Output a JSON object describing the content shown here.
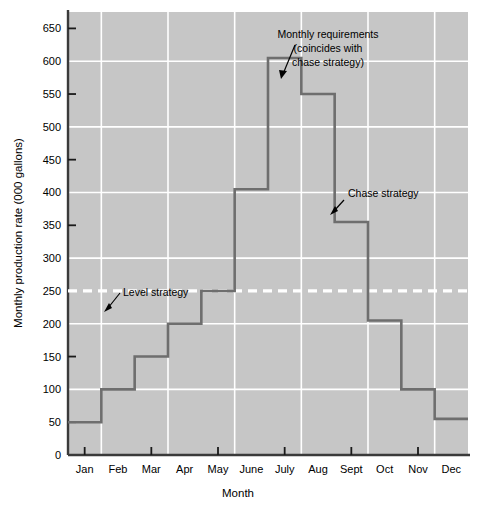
{
  "chart_data": {
    "type": "line",
    "subtype": "step",
    "title": "",
    "xlabel": "Month",
    "ylabel": "Monthly production rate (000 gallons)",
    "categories": [
      "Jan",
      "Feb",
      "Mar",
      "Apr",
      "May",
      "June",
      "July",
      "Aug",
      "Sept",
      "Oct",
      "Nov",
      "Dec"
    ],
    "series": [
      {
        "name": "Monthly requirements (coincides with chase strategy)",
        "step": "post",
        "color": "#6e6e6e",
        "values": [
          50,
          100,
          150,
          200,
          250,
          405,
          605,
          550,
          355,
          205,
          100,
          55
        ]
      },
      {
        "name": "Level strategy",
        "style": "dashed",
        "color": "#ffffff",
        "constant_value": 250
      }
    ],
    "ylim": [
      0,
      675
    ],
    "ytick_values": [
      0,
      50,
      100,
      150,
      200,
      250,
      300,
      350,
      400,
      450,
      500,
      550,
      600,
      650
    ],
    "ytick_labels": [
      "0",
      "50",
      "100",
      "150",
      "200",
      "250",
      "300",
      "350",
      "400",
      "450",
      "500",
      "550",
      "600",
      "650"
    ],
    "ygrid_values": [
      100,
      200,
      300,
      400,
      500,
      600
    ],
    "xtick_labeled": [
      "Jan",
      "Mar",
      "May",
      "July",
      "Sept",
      "Nov"
    ],
    "grid": true,
    "grid_color": "#ffffff",
    "plot_background": "#c6c6c6",
    "legend_position": "none",
    "annotations": [
      {
        "name": "monthly-requirements-annotation",
        "lines": [
          "Monthly requirements",
          "(coincides with",
          "chase strategy)"
        ],
        "target_month": "July",
        "target_value": 605
      },
      {
        "name": "chase-strategy-annotation",
        "lines": [
          "Chase strategy"
        ],
        "target_month": "Sept",
        "target_value": 400
      },
      {
        "name": "level-strategy-annotation",
        "lines": [
          "Level strategy"
        ],
        "target_month": "Feb",
        "target_value": 250
      }
    ]
  },
  "axes": {
    "y_title": "Monthly production rate (000 gallons)",
    "x_title": "Month",
    "y_ticks": [
      "650",
      "600",
      "550",
      "500",
      "450",
      "400",
      "350",
      "300",
      "250",
      "200",
      "150",
      "100",
      "50",
      "0"
    ],
    "x_ticks": [
      "Jan",
      "Feb",
      "Mar",
      "Apr",
      "May",
      "June",
      "July",
      "Aug",
      "Sept",
      "Oct",
      "Nov",
      "Dec"
    ]
  },
  "annotation_text": {
    "monthly_requirements_l1": "Monthly requirements",
    "monthly_requirements_l2": "(coincides with",
    "monthly_requirements_l3": "chase strategy)",
    "chase_strategy": "Chase strategy",
    "level_strategy": "Level strategy"
  }
}
